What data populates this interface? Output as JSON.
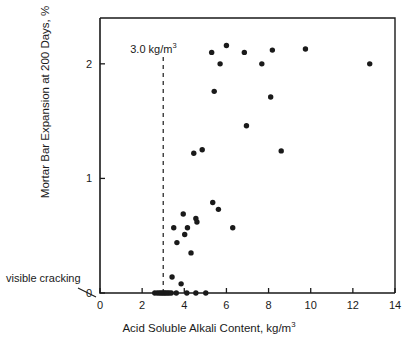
{
  "chart_data": {
    "type": "scatter",
    "title": "",
    "xlabel": "Acid Soluble Alkali Content, kg/m3",
    "ylabel": "Mortar Bar Expansion at 200 Days, %",
    "xlim": [
      0,
      14
    ],
    "ylim": [
      0,
      2.4
    ],
    "xticks": [
      0,
      2,
      4,
      6,
      8,
      10,
      12,
      14
    ],
    "yticks": [
      0,
      1,
      2
    ],
    "xtick_labels": [
      "0",
      "2",
      "4",
      "6",
      "8",
      "10",
      "12",
      "14"
    ],
    "ytick_labels": [
      "0",
      "1",
      "2"
    ],
    "grid": false,
    "legend": null,
    "annotations": [
      {
        "name": "threshold-line",
        "kind": "vertical-dashed-line",
        "x": 3.0,
        "label": "3.0 kg/m3",
        "label_html": "3.0 kg/m<sup>3</sup>"
      },
      {
        "name": "visible-cracking-note",
        "kind": "text-with-leader",
        "label": "visible cracking",
        "points_to": [
          0,
          0
        ]
      }
    ],
    "series": [
      {
        "name": "mortar bars",
        "marker": "filled-circle",
        "color": "#1a1a1a",
        "points": [
          [
            2.6,
            0.0
          ],
          [
            2.72,
            0.0
          ],
          [
            2.82,
            0.0
          ],
          [
            2.9,
            0.0
          ],
          [
            2.98,
            0.0
          ],
          [
            3.05,
            0.0
          ],
          [
            3.12,
            0.0
          ],
          [
            3.2,
            0.0
          ],
          [
            3.28,
            0.0
          ],
          [
            3.38,
            0.0
          ],
          [
            3.62,
            0.0
          ],
          [
            4.12,
            0.0
          ],
          [
            4.55,
            0.0
          ],
          [
            5.02,
            0.0
          ],
          [
            3.42,
            0.14
          ],
          [
            3.85,
            0.08
          ],
          [
            3.65,
            0.44
          ],
          [
            4.32,
            0.35
          ],
          [
            4.15,
            0.57
          ],
          [
            4.02,
            0.51
          ],
          [
            3.5,
            0.57
          ],
          [
            3.95,
            0.69
          ],
          [
            4.55,
            0.65
          ],
          [
            4.6,
            0.62
          ],
          [
            5.35,
            0.79
          ],
          [
            5.62,
            0.73
          ],
          [
            6.3,
            0.57
          ],
          [
            4.45,
            1.22
          ],
          [
            4.85,
            1.25
          ],
          [
            8.6,
            1.24
          ],
          [
            6.95,
            1.46
          ],
          [
            8.1,
            1.71
          ],
          [
            5.42,
            1.76
          ],
          [
            5.3,
            2.1
          ],
          [
            5.7,
            2.0
          ],
          [
            6.0,
            2.16
          ],
          [
            6.85,
            2.1
          ],
          [
            7.68,
            2.0
          ],
          [
            8.18,
            2.12
          ],
          [
            9.75,
            2.13
          ],
          [
            12.8,
            2.0
          ]
        ]
      }
    ]
  },
  "axes_geometry": {
    "plot_left_px": 100,
    "plot_right_px": 395,
    "plot_top_px": 18,
    "plot_bottom_px": 293
  }
}
